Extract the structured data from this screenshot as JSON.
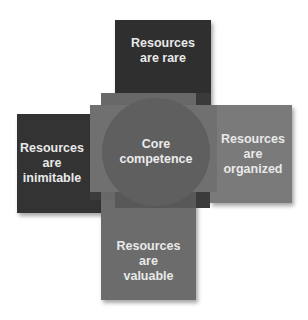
{
  "diagram": {
    "type": "overlapping-boxes-around-circle",
    "center": {
      "label": "Core\ncompetence",
      "color": "#5f5f5f"
    },
    "boxes": [
      {
        "position": "top",
        "label": "Resources\nare rare",
        "color": "#2f2f2f"
      },
      {
        "position": "left",
        "label": "Resources\nare\ninimitable",
        "color": "#333333"
      },
      {
        "position": "right",
        "label": "Resources\nare\norganized",
        "color": "#7a7a7a"
      },
      {
        "position": "bottom",
        "label": "Resources\nare\nvaluable",
        "color": "#6c6c6c"
      }
    ],
    "colors": {
      "background": "#ffffff",
      "overlap_tall": "#6a6a6a",
      "overlap_wide": "#727272",
      "text": "#e9e9e9"
    }
  }
}
